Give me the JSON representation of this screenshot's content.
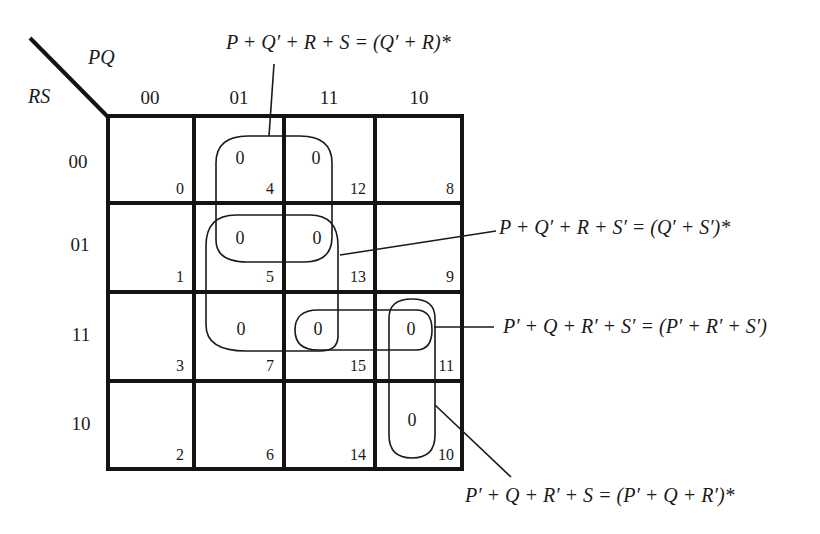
{
  "kmap": {
    "col_var_label": "PQ",
    "row_var_label": "RS",
    "col_headers": [
      "00",
      "01",
      "11",
      "10"
    ],
    "row_headers": [
      "00",
      "01",
      "11",
      "10"
    ],
    "cells": [
      [
        {
          "index": "0",
          "value": ""
        },
        {
          "index": "4",
          "value": "0"
        },
        {
          "index": "12",
          "value": "0"
        },
        {
          "index": "8",
          "value": ""
        }
      ],
      [
        {
          "index": "1",
          "value": ""
        },
        {
          "index": "5",
          "value": "0"
        },
        {
          "index": "13",
          "value": "0"
        },
        {
          "index": "9",
          "value": ""
        }
      ],
      [
        {
          "index": "3",
          "value": ""
        },
        {
          "index": "7",
          "value": "0"
        },
        {
          "index": "15",
          "value": "0"
        },
        {
          "index": "11",
          "value": "0"
        }
      ],
      [
        {
          "index": "2",
          "value": ""
        },
        {
          "index": "6",
          "value": ""
        },
        {
          "index": "14",
          "value": ""
        },
        {
          "index": "10",
          "value": "0"
        }
      ]
    ]
  },
  "annotations": {
    "top": "P + Q′ + R + S = (Q′ + R)*",
    "right_upper": "P + Q′ + R + S′ = (Q′ + S′)*",
    "right_middle": "P′ + Q + R′ + S′ = (P′ + R′ + S′)",
    "bottom": "P′ + Q + R′ + S = (P′ + Q + R′)*"
  }
}
